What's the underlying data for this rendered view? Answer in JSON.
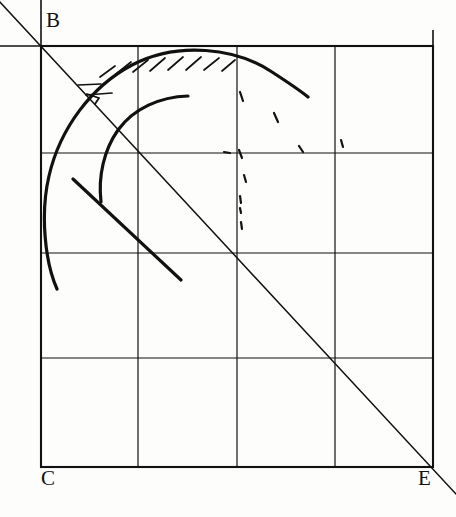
{
  "figure": {
    "kind": "hand-drawn-geometric-diagram",
    "background_color": "#fdfdfc",
    "ink_color": "#111111",
    "width": 456,
    "height": 517,
    "labels": [
      {
        "name": "vertex-label-B",
        "text": "B",
        "x": 46,
        "y": 10
      },
      {
        "name": "vertex-label-C",
        "text": "C",
        "x": 41,
        "y": 468
      },
      {
        "name": "vertex-label-E",
        "text": "E",
        "x": 418,
        "y": 468
      }
    ],
    "square": {
      "name": "bounding-square",
      "left": 41,
      "top": 46,
      "right": 433,
      "bottom": 467,
      "stroke_width": 2.1
    },
    "grid": {
      "name": "grid-lines",
      "columns": 4,
      "rows": 4,
      "vertical_x": [
        41,
        138,
        237,
        335,
        433
      ],
      "horizontal_y": [
        46,
        153,
        253,
        358,
        467
      ],
      "stroke_width": 1.2
    },
    "diagonal": {
      "name": "diagonal-B-to-E",
      "x1": -2,
      "y1": 0,
      "x2": 456,
      "y2": 494,
      "stroke_width": 1.5,
      "note": "passes through corner B (41,46) and corner E (433,467), extends past both"
    },
    "axis_extensions": [
      {
        "name": "horizontal-extension-left-of-B",
        "x1": 0,
        "y1": 46,
        "x2": 41,
        "y2": 46
      },
      {
        "name": "vertical-extension-above-B",
        "x1": 41,
        "y1": 0,
        "x2": 41,
        "y2": 46
      },
      {
        "name": "vertical-extension-above-top-right",
        "x1": 433,
        "y1": 30,
        "x2": 433,
        "y2": 46
      }
    ],
    "outer_arc": {
      "name": "outer-curve",
      "stroke_width": 3.2,
      "path": "M 57,289 C 45,262 40,214 49,176 C 60,128 92,86 132,65 C 178,41 236,48 272,72 C 292,85 302,92 308,97",
      "description": "large hand-drawn arc rising from lower-left, peaking near top-center, descending to the right"
    },
    "inner_arc": {
      "name": "inner-curve",
      "stroke_width": 3.2,
      "path": "M 101,202 C 98,176 104,150 118,130 C 134,108 160,97 188,96",
      "description": "smaller hand-drawn arc inside the outer curve"
    },
    "straight_stroke": {
      "name": "straight-chord-stroke",
      "stroke_width": 3.2,
      "x1": 73,
      "y1": 179,
      "x2": 181,
      "y2": 280,
      "description": "free straight pencil stroke running down-right inside the figure"
    },
    "arrow_tick": {
      "name": "arrow-tick-at-arc-intersection",
      "x": 85,
      "y": 93,
      "description": "small arrowhead/tick where the diagonal meets the outer arc"
    },
    "hatching": {
      "name": "hatch-marks-under-outer-arc",
      "count": 9,
      "description": "short slanted tick marks hanging below the outer arc near its crest",
      "marks": [
        {
          "x1": 78,
          "y1": 85,
          "x2": 101,
          "y2": 84
        },
        {
          "x1": 86,
          "y1": 95,
          "x2": 112,
          "y2": 93
        },
        {
          "x1": 100,
          "y1": 77,
          "x2": 115,
          "y2": 66
        },
        {
          "x1": 116,
          "y1": 74,
          "x2": 131,
          "y2": 62
        },
        {
          "x1": 133,
          "y1": 72,
          "x2": 148,
          "y2": 60
        },
        {
          "x1": 150,
          "y1": 71,
          "x2": 165,
          "y2": 58
        },
        {
          "x1": 168,
          "y1": 70,
          "x2": 183,
          "y2": 57
        },
        {
          "x1": 186,
          "y1": 70,
          "x2": 201,
          "y2": 57
        },
        {
          "x1": 204,
          "y1": 70,
          "x2": 219,
          "y2": 58
        },
        {
          "x1": 222,
          "y1": 71,
          "x2": 235,
          "y2": 60
        }
      ]
    },
    "stray_marks": {
      "name": "faint-stray-pencil-dots",
      "description": "scattered small dashes and dots in the upper-right quadrant",
      "marks": [
        {
          "x1": 240,
          "y1": 92,
          "x2": 243,
          "y2": 101
        },
        {
          "x1": 274,
          "y1": 113,
          "x2": 278,
          "y2": 122
        },
        {
          "x1": 239,
          "y1": 150,
          "x2": 242,
          "y2": 158
        },
        {
          "x1": 299,
          "y1": 146,
          "x2": 303,
          "y2": 152
        },
        {
          "x1": 224,
          "y1": 152,
          "x2": 230,
          "y2": 153
        },
        {
          "x1": 244,
          "y1": 175,
          "x2": 246,
          "y2": 182
        },
        {
          "x1": 240,
          "y1": 196,
          "x2": 241,
          "y2": 203
        },
        {
          "x1": 240,
          "y1": 208,
          "x2": 241,
          "y2": 213
        },
        {
          "x1": 241,
          "y1": 222,
          "x2": 242,
          "y2": 229
        },
        {
          "x1": 341,
          "y1": 140,
          "x2": 343,
          "y2": 147
        }
      ]
    }
  }
}
